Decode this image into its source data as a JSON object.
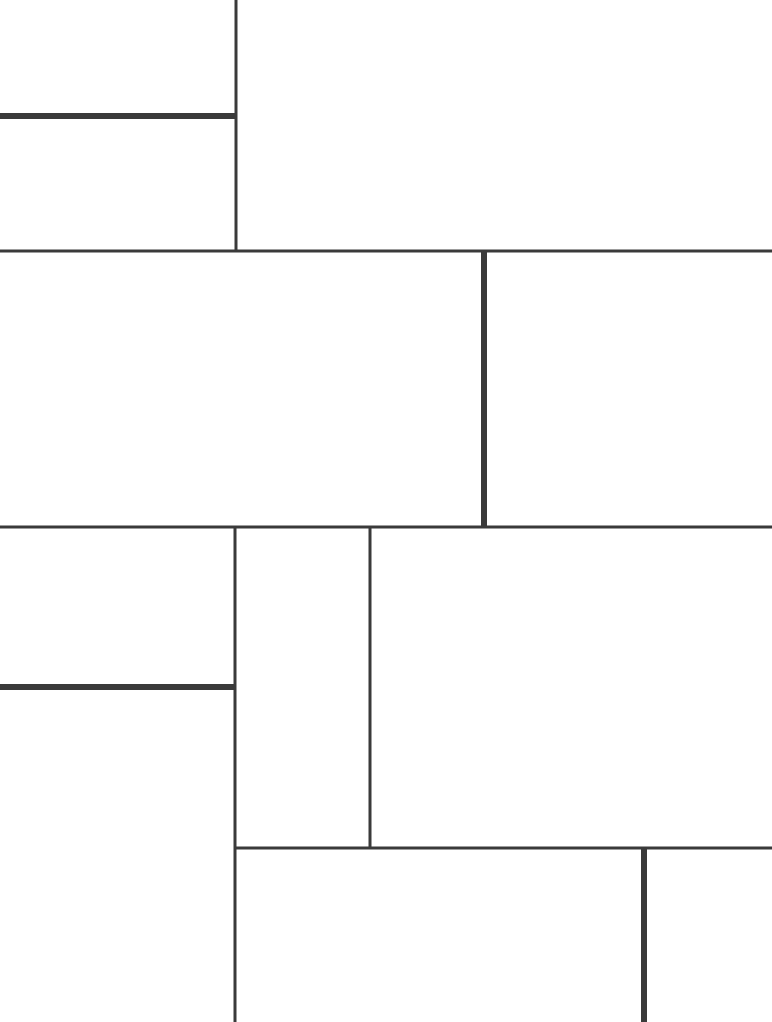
{
  "diagram": {
    "type": "line-partition",
    "colors": {
      "background": "#ffffff",
      "line": "#3a3a3a"
    },
    "regions": [
      {
        "id": "top-left-upper"
      },
      {
        "id": "top-left-lower"
      },
      {
        "id": "top-right"
      },
      {
        "id": "middle-left"
      },
      {
        "id": "middle-right"
      },
      {
        "id": "lower-left-upper"
      },
      {
        "id": "lower-left-lower"
      },
      {
        "id": "lower-center-narrow"
      },
      {
        "id": "lower-right-large"
      },
      {
        "id": "bottom-center"
      },
      {
        "id": "bottom-right"
      }
    ]
  }
}
